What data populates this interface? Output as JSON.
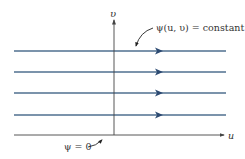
{
  "diagram": {
    "axes": {
      "x_label": "u",
      "y_label": "υ"
    },
    "annotations": {
      "streamline_label": "ψ(u, υ) = constant",
      "baseline_label": "ψ = 0"
    },
    "streamlines": [
      {
        "y": 51
      },
      {
        "y": 72
      },
      {
        "y": 93
      },
      {
        "y": 115
      }
    ],
    "colors": {
      "streamline": "#4f6f8f",
      "arrowhead": "#2c4a72",
      "axis": "#444444"
    }
  }
}
